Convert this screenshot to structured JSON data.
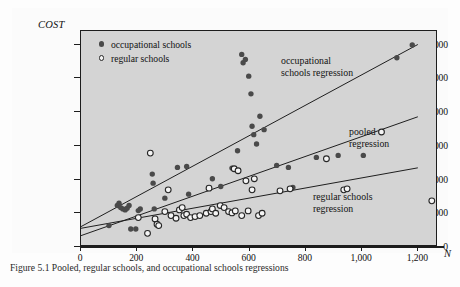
{
  "figure": {
    "caption_prefix": "Figure 5.1",
    "caption_text": "Pooled, regular schools, and occupational schools regressions"
  },
  "legend": {
    "position": "top-left-inside",
    "items": [
      {
        "marker": "filled-circle-icon",
        "label": "occupational schools"
      },
      {
        "marker": "open-circle-icon",
        "label": "regular schools"
      }
    ]
  },
  "annotations": [
    {
      "name": "occupational-schools-regression-label",
      "text": "occupational\nschools regression"
    },
    {
      "name": "pooled-regression-label",
      "text": "pooled\nregression"
    },
    {
      "name": "regular-schools-regression-label",
      "text": "regular schools\nregression"
    }
  ],
  "chart_data": {
    "type": "scatter",
    "title": "",
    "xlabel": "N",
    "ylabel": "COST",
    "xlim": [
      0,
      1270
    ],
    "ylim": [
      0,
      640000
    ],
    "grid": false,
    "legend_position": "upper left",
    "xticks": [
      0,
      200,
      400,
      600,
      800,
      1000,
      1200
    ],
    "xtick_labels": [
      "0",
      "200",
      "400",
      "600",
      "800",
      "1,000",
      "1,200"
    ],
    "yticks": [
      0,
      100000,
      200000,
      300000,
      400000,
      500000,
      600000
    ],
    "ytick_labels": [
      "0",
      "100,000",
      "200,000",
      "300,000",
      "400,000",
      "500,000",
      "600,000"
    ],
    "series": [
      {
        "name": "occupational schools",
        "marker": "filled-circle",
        "color": "#4a4a4a",
        "points": [
          [
            100,
            58000
          ],
          [
            130,
            118000
          ],
          [
            136,
            125000
          ],
          [
            142,
            112000
          ],
          [
            150,
            108000
          ],
          [
            158,
            105000
          ],
          [
            165,
            110000
          ],
          [
            172,
            118000
          ],
          [
            178,
            48000
          ],
          [
            196,
            48000
          ],
          [
            205,
            103000
          ],
          [
            212,
            108000
          ],
          [
            255,
            212000
          ],
          [
            258,
            185000
          ],
          [
            262,
            108000
          ],
          [
            300,
            140000
          ],
          [
            345,
            232000
          ],
          [
            378,
            235000
          ],
          [
            385,
            152000
          ],
          [
            470,
            198000
          ],
          [
            500,
            175000
          ],
          [
            540,
            230000
          ],
          [
            560,
            282000
          ],
          [
            575,
            570000
          ],
          [
            580,
            545000
          ],
          [
            588,
            555000
          ],
          [
            600,
            505000
          ],
          [
            608,
            452000
          ],
          [
            612,
            355000
          ],
          [
            618,
            330000
          ],
          [
            628,
            302000
          ],
          [
            640,
            385000
          ],
          [
            655,
            345000
          ],
          [
            700,
            238000
          ],
          [
            742,
            232000
          ],
          [
            758,
            172000
          ],
          [
            842,
            262000
          ],
          [
            920,
            268000
          ],
          [
            1010,
            268000
          ],
          [
            1130,
            560000
          ],
          [
            1185,
            598000
          ]
        ]
      },
      {
        "name": "regular schools",
        "marker": "open-circle",
        "color": "#f2f2f2",
        "points": [
          [
            205,
            82000
          ],
          [
            238,
            35000
          ],
          [
            248,
            275000
          ],
          [
            265,
            78000
          ],
          [
            272,
            62000
          ],
          [
            278,
            58000
          ],
          [
            300,
            100000
          ],
          [
            312,
            165000
          ],
          [
            322,
            88000
          ],
          [
            340,
            80000
          ],
          [
            352,
            105000
          ],
          [
            362,
            112000
          ],
          [
            368,
            88000
          ],
          [
            378,
            92000
          ],
          [
            392,
            82000
          ],
          [
            408,
            85000
          ],
          [
            425,
            88000
          ],
          [
            448,
            95000
          ],
          [
            458,
            170000
          ],
          [
            465,
            100000
          ],
          [
            470,
            108000
          ],
          [
            482,
            95000
          ],
          [
            498,
            118000
          ],
          [
            512,
            112000
          ],
          [
            528,
            100000
          ],
          [
            540,
            96000
          ],
          [
            548,
            228000
          ],
          [
            552,
            102000
          ],
          [
            562,
            222000
          ],
          [
            575,
            88000
          ],
          [
            590,
            192000
          ],
          [
            598,
            102000
          ],
          [
            612,
            165000
          ],
          [
            620,
            198000
          ],
          [
            635,
            88000
          ],
          [
            648,
            95000
          ],
          [
            712,
            162000
          ],
          [
            748,
            168000
          ],
          [
            878,
            258000
          ],
          [
            940,
            165000
          ],
          [
            952,
            168000
          ],
          [
            1075,
            338000
          ],
          [
            1255,
            132000
          ]
        ]
      }
    ],
    "regression_lines": [
      {
        "name": "occupational schools regression",
        "intercept": 55000,
        "slope": 452,
        "x_range": [
          0,
          1205
        ]
      },
      {
        "name": "pooled regression",
        "intercept": 28000,
        "slope": 295,
        "x_range": [
          0,
          1205
        ]
      },
      {
        "name": "regular schools regression",
        "intercept": 50000,
        "slope": 150,
        "x_range": [
          0,
          1205
        ]
      }
    ]
  }
}
